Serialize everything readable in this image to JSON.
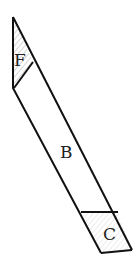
{
  "diagram": {
    "type": "parallelogram-strip",
    "stroke_color": "#111111",
    "background": "#ffffff",
    "regions": [
      {
        "id": "F",
        "label": "F",
        "hatched": true
      },
      {
        "id": "B",
        "label": "B",
        "hatched": false
      },
      {
        "id": "C",
        "label": "C",
        "hatched": true
      }
    ]
  }
}
